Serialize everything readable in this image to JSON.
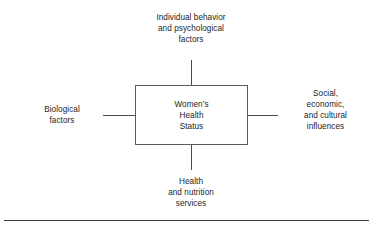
{
  "diagram": {
    "center": {
      "name": "central-node",
      "text": "Women’s\nHealth\nStatus"
    },
    "nodes": [
      {
        "id": "individual-behavior",
        "position": "top",
        "text": "Individual behavior\nand psychological\nfactors"
      },
      {
        "id": "biological-factors",
        "position": "left",
        "text": "Biological\nfactors"
      },
      {
        "id": "social-economic-cultural",
        "position": "right",
        "text": "Social,\neconomic,\nand cultural\ninfluences"
      },
      {
        "id": "health-nutrition-services",
        "position": "bottom",
        "text": "Health\nand nutrition\nservices"
      }
    ],
    "connectors": [
      {
        "id": "connector-top",
        "orientation": "vertical",
        "from": "individual-behavior",
        "to": "central-node"
      },
      {
        "id": "connector-left",
        "orientation": "horizontal",
        "from": "biological-factors",
        "to": "central-node"
      },
      {
        "id": "connector-right",
        "orientation": "horizontal",
        "from": "central-node",
        "to": "social-economic-cultural"
      },
      {
        "id": "connector-bottom",
        "orientation": "vertical",
        "from": "central-node",
        "to": "health-nutrition-services"
      }
    ],
    "colors": {
      "background": "#ffffff",
      "text": "#1d1d1d",
      "box_border": "#5b5b5b",
      "connector": "#4a4a4a",
      "footer_rule": "#3a3a3a"
    }
  }
}
